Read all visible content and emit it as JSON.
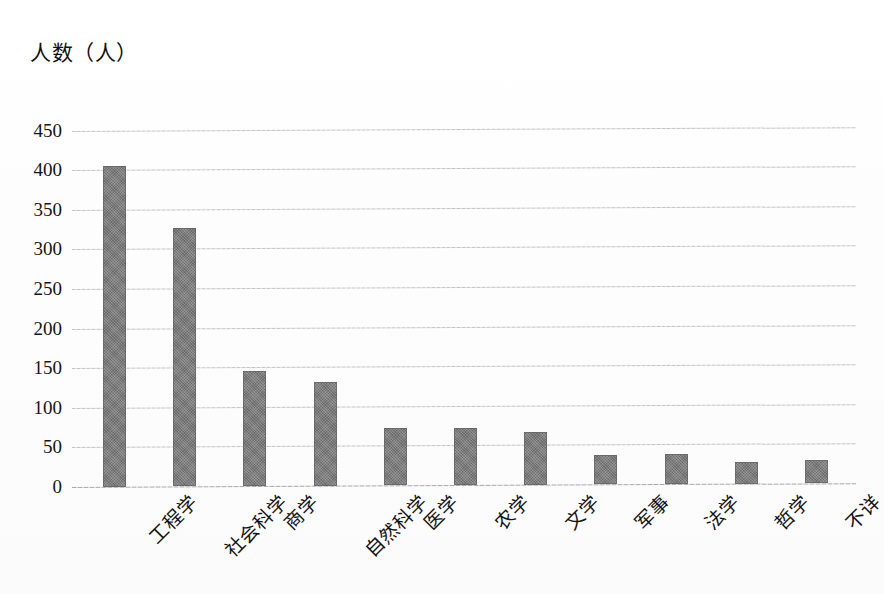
{
  "chart_data": {
    "type": "bar",
    "title": "",
    "ylabel": "人数（人）",
    "xlabel": "",
    "categories": [
      "工程学",
      "社会科学",
      "商学",
      "自然科学",
      "医学",
      "农学",
      "文学",
      "军事",
      "法学",
      "哲学",
      "不详"
    ],
    "values": [
      405,
      327,
      145,
      131,
      72,
      72,
      67,
      37,
      38,
      27,
      29
    ],
    "ylim": [
      0,
      450
    ],
    "ytick_labels": [
      "450",
      "400",
      "350",
      "300",
      "250",
      "200",
      "150",
      "100",
      "50",
      "0"
    ],
    "ytick_values": [
      450,
      400,
      350,
      300,
      250,
      200,
      150,
      100,
      50,
      0
    ],
    "grid": true,
    "legend": false,
    "series_color": "#757575",
    "gridline_color": "#c4c4c4",
    "background_color": "#fdfdfd"
  }
}
